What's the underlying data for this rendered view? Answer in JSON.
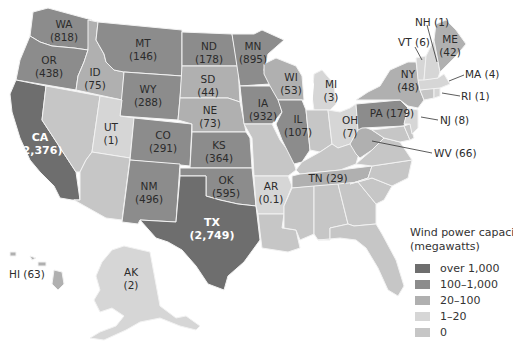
{
  "legend": {
    "title_line1": "Wind power capacity",
    "title_line2": "(megawatts)",
    "classes": [
      {
        "label": "over 1,000",
        "color": "#6e6e6e"
      },
      {
        "label": "100–1,000",
        "color": "#8c8c8c"
      },
      {
        "label": "20–100",
        "color": "#b0b0b0"
      },
      {
        "label": "1–20",
        "color": "#d6d6d6"
      },
      {
        "label": "0",
        "color": "#c6c6c6"
      }
    ]
  },
  "states": {
    "WA": {
      "abbr": "WA",
      "value": "(818)",
      "class": 1
    },
    "OR": {
      "abbr": "OR",
      "value": "(438)",
      "class": 1
    },
    "CA": {
      "abbr": "CA",
      "value": "(2,376)",
      "class": 0
    },
    "ID": {
      "abbr": "ID",
      "value": "(75)",
      "class": 2
    },
    "NV": {
      "abbr": "",
      "value": "",
      "class": 4
    },
    "MT": {
      "abbr": "MT",
      "value": "(146)",
      "class": 1
    },
    "WY": {
      "abbr": "WY",
      "value": "(288)",
      "class": 1
    },
    "UT": {
      "abbr": "UT",
      "value": "(1)",
      "class": 3
    },
    "AZ": {
      "abbr": "",
      "value": "",
      "class": 4
    },
    "CO": {
      "abbr": "CO",
      "value": "(291)",
      "class": 1
    },
    "NM": {
      "abbr": "NM",
      "value": "(496)",
      "class": 1
    },
    "ND": {
      "abbr": "ND",
      "value": "(178)",
      "class": 1
    },
    "SD": {
      "abbr": "SD",
      "value": "(44)",
      "class": 2
    },
    "NE": {
      "abbr": "NE",
      "value": "(73)",
      "class": 2
    },
    "KS": {
      "abbr": "KS",
      "value": "(364)",
      "class": 1
    },
    "OK": {
      "abbr": "OK",
      "value": "(595)",
      "class": 1
    },
    "TX": {
      "abbr": "TX",
      "value": "(2,749)",
      "class": 0
    },
    "MN": {
      "abbr": "MN",
      "value": "(895)",
      "class": 1
    },
    "IA": {
      "abbr": "IA",
      "value": "(932)",
      "class": 1
    },
    "MO": {
      "abbr": "",
      "value": "",
      "class": 4
    },
    "AR": {
      "abbr": "AR",
      "value": "(0.1)",
      "class": 3
    },
    "LA": {
      "abbr": "",
      "value": "",
      "class": 4
    },
    "WI": {
      "abbr": "WI",
      "value": "(53)",
      "class": 2
    },
    "IL": {
      "abbr": "IL",
      "value": "(107)",
      "class": 1
    },
    "MI": {
      "abbr": "MI",
      "value": "(3)",
      "class": 3
    },
    "IN": {
      "abbr": "",
      "value": "",
      "class": 4
    },
    "OH": {
      "abbr": "OH",
      "value": "(7)",
      "class": 3
    },
    "KY": {
      "abbr": "",
      "value": "",
      "class": 4
    },
    "TN": {
      "abbr": "TN",
      "value": "(29)",
      "class": 2
    },
    "MS": {
      "abbr": "",
      "value": "",
      "class": 4
    },
    "AL": {
      "abbr": "",
      "value": "",
      "class": 4
    },
    "GA": {
      "abbr": "",
      "value": "",
      "class": 4
    },
    "FL": {
      "abbr": "",
      "value": "",
      "class": 4
    },
    "SC": {
      "abbr": "",
      "value": "",
      "class": 4
    },
    "NC": {
      "abbr": "",
      "value": "",
      "class": 4
    },
    "VA": {
      "abbr": "",
      "value": "",
      "class": 4
    },
    "WV": {
      "abbr": "WV",
      "value": "(66)",
      "class": 2
    },
    "PA": {
      "abbr": "PA",
      "value": "(179)",
      "class": 1
    },
    "NY": {
      "abbr": "NY",
      "value": "(48)",
      "class": 2
    },
    "VT": {
      "abbr": "VT",
      "value": "(6)",
      "class": 3
    },
    "NH": {
      "abbr": "NH",
      "value": "(1)",
      "class": 3
    },
    "ME": {
      "abbr": "ME",
      "value": "(42)",
      "class": 2
    },
    "MA": {
      "abbr": "MA",
      "value": "(4)",
      "class": 3
    },
    "RI": {
      "abbr": "RI",
      "value": "(1)",
      "class": 3
    },
    "CT": {
      "abbr": "",
      "value": "",
      "class": 4
    },
    "NJ": {
      "abbr": "NJ",
      "value": "(8)",
      "class": 3
    },
    "DE": {
      "abbr": "",
      "value": "",
      "class": 4
    },
    "MD": {
      "abbr": "",
      "value": "",
      "class": 4
    },
    "AK": {
      "abbr": "AK",
      "value": "(2)",
      "class": 3
    },
    "HI": {
      "abbr": "HI",
      "value": "(63)",
      "class": 2
    }
  }
}
